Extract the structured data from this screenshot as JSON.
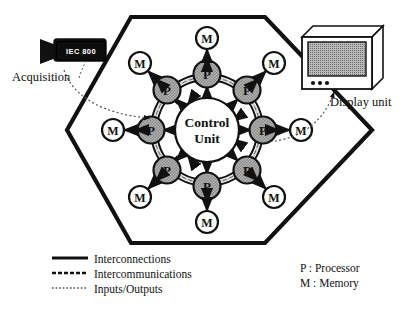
{
  "diagram": {
    "center_node": {
      "line1": "Control",
      "line2": "Unit"
    },
    "processor_label": "P",
    "memory_label": "M",
    "processor_count": 8,
    "memory_count": 8,
    "boundary_shape": "hexagon"
  },
  "devices": {
    "acquisition": {
      "device_label": "IEC 800",
      "caption": "Acquisition"
    },
    "display": {
      "caption": "Display unit",
      "icon": "crt-monitor-icon",
      "button_count": 3
    }
  },
  "legend": {
    "lines": [
      {
        "style": "solid",
        "label": "Interconnections"
      },
      {
        "style": "dashed",
        "label": "Intercommunications"
      },
      {
        "style": "dotted",
        "label": "Inputs/Outputs"
      }
    ],
    "keys": [
      {
        "label": "P : Processor"
      },
      {
        "label": "M : Memory"
      }
    ]
  },
  "colors": {
    "ink": "#111111",
    "processor_fill": "#a8a8a8",
    "memory_fill": "#ffffff",
    "screen_fill": "#a0a0a0",
    "device_fill": "#0d0d0d"
  }
}
